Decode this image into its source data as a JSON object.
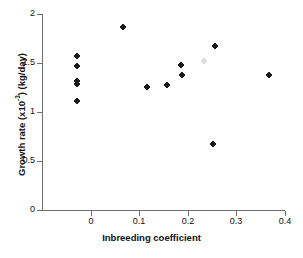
{
  "chart_data": {
    "type": "scatter",
    "title": "",
    "xlabel": "Inbreeding coefficient",
    "ylabel_text": "Growth rate (x10",
    "ylabel_exp": "-3",
    "ylabel_tail": ") (kg/day)",
    "ylabel_full": "Growth rate (x10-3) (kg/day)",
    "xlim": [
      -0.1,
      0.4
    ],
    "ylim": [
      0,
      2
    ],
    "xticks": [
      0,
      0.1,
      0.2,
      0.3,
      0.4
    ],
    "xtick_labels": [
      "0",
      "0.1",
      "0.2",
      "0.3",
      "0.4"
    ],
    "yticks": [
      0,
      0.5,
      1,
      1.5,
      2
    ],
    "ytick_labels": [
      "0",
      "0.5",
      "1",
      "1.5",
      "2"
    ],
    "grid": false,
    "legend": false,
    "marker": "filled-diamond-plus",
    "marker_color": "#1a1a1a",
    "axis_color": "#6f6f6f",
    "series": [
      {
        "name": "growth rate vs inbreeding coefficient",
        "points": [
          {
            "x": -0.028,
            "y": 1.57
          },
          {
            "x": -0.028,
            "y": 1.47
          },
          {
            "x": -0.028,
            "y": 1.32
          },
          {
            "x": -0.028,
            "y": 1.29
          },
          {
            "x": -0.028,
            "y": 1.11
          },
          {
            "x": 0.067,
            "y": 1.87
          },
          {
            "x": 0.116,
            "y": 1.26
          },
          {
            "x": 0.157,
            "y": 1.28
          },
          {
            "x": 0.186,
            "y": 1.48
          },
          {
            "x": 0.188,
            "y": 1.38
          },
          {
            "x": 0.255,
            "y": 1.67
          },
          {
            "x": 0.251,
            "y": 0.67
          },
          {
            "x": 0.368,
            "y": 1.38
          },
          {
            "x": 0.233,
            "y": 1.52,
            "faint": true
          }
        ]
      }
    ]
  },
  "caption": {
    "text": ""
  }
}
